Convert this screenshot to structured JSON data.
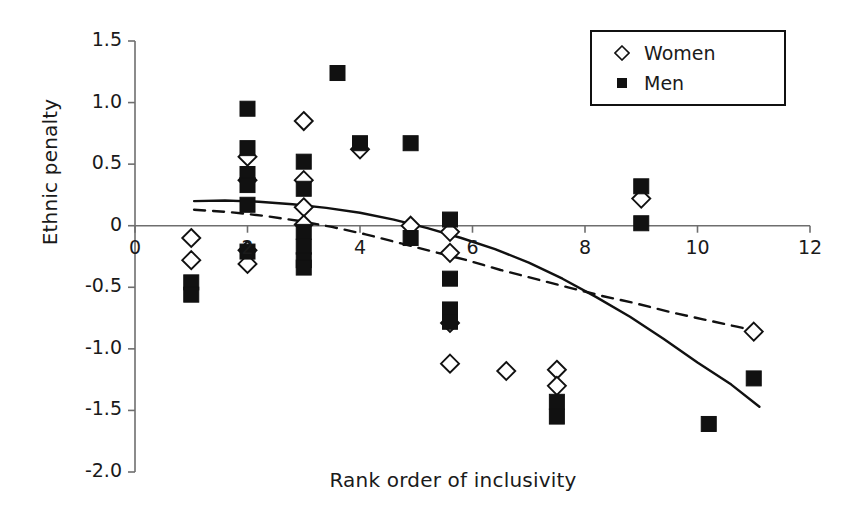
{
  "chart_data": {
    "type": "scatter",
    "title": "",
    "xlabel": "Rank order of inclusivity",
    "ylabel": "Ethnic penalty",
    "xlim": [
      0,
      12
    ],
    "ylim": [
      -2.0,
      1.5
    ],
    "xticks": [
      0,
      2,
      4,
      6,
      8,
      10,
      12
    ],
    "xtick_labels": [
      "0",
      "2",
      "4",
      "6",
      "8",
      "10",
      "12"
    ],
    "yticks": [
      1.5,
      1.0,
      0.5,
      0,
      -0.5,
      -1.0,
      -1.5,
      -2.0
    ],
    "ytick_labels": [
      "1.5",
      "1.0",
      "0.5",
      "0",
      "-0.5",
      "-1.0",
      "-1.5",
      "-2.0"
    ],
    "grid": false,
    "legend_position": "top-right",
    "series": [
      {
        "name": "Women",
        "marker": "open-diamond",
        "color": "#ffffff",
        "edge_color": "#111111",
        "points": [
          {
            "x": 1.0,
            "y": -0.1
          },
          {
            "x": 1.0,
            "y": -0.28
          },
          {
            "x": 2.0,
            "y": 0.56
          },
          {
            "x": 2.0,
            "y": 0.37
          },
          {
            "x": 2.0,
            "y": -0.2
          },
          {
            "x": 2.0,
            "y": -0.31
          },
          {
            "x": 3.0,
            "y": 0.85
          },
          {
            "x": 3.0,
            "y": 0.37
          },
          {
            "x": 3.0,
            "y": 0.15
          },
          {
            "x": 3.0,
            "y": 0.01
          },
          {
            "x": 4.0,
            "y": 0.62
          },
          {
            "x": 4.9,
            "y": 0.0
          },
          {
            "x": 5.6,
            "y": -0.05
          },
          {
            "x": 5.6,
            "y": -0.22
          },
          {
            "x": 5.6,
            "y": -0.79
          },
          {
            "x": 5.6,
            "y": -1.12
          },
          {
            "x": 6.6,
            "y": -1.18
          },
          {
            "x": 7.5,
            "y": -1.17
          },
          {
            "x": 7.5,
            "y": -1.3
          },
          {
            "x": 9.0,
            "y": 0.22
          },
          {
            "x": 11.0,
            "y": -0.86
          }
        ]
      },
      {
        "name": "Men",
        "marker": "filled-square",
        "color": "#111111",
        "edge_color": "#111111",
        "points": [
          {
            "x": 1.0,
            "y": -0.46
          },
          {
            "x": 1.0,
            "y": -0.56
          },
          {
            "x": 2.0,
            "y": 0.95
          },
          {
            "x": 2.0,
            "y": 0.63
          },
          {
            "x": 2.0,
            "y": 0.42
          },
          {
            "x": 2.0,
            "y": 0.33
          },
          {
            "x": 2.0,
            "y": 0.17
          },
          {
            "x": 2.0,
            "y": -0.21
          },
          {
            "x": 3.0,
            "y": 0.52
          },
          {
            "x": 3.0,
            "y": 0.3
          },
          {
            "x": 3.0,
            "y": -0.05
          },
          {
            "x": 3.0,
            "y": -0.17
          },
          {
            "x": 3.0,
            "y": -0.28
          },
          {
            "x": 3.0,
            "y": -0.34
          },
          {
            "x": 3.6,
            "y": 1.24
          },
          {
            "x": 4.0,
            "y": 0.67
          },
          {
            "x": 4.9,
            "y": 0.67
          },
          {
            "x": 4.9,
            "y": -0.1
          },
          {
            "x": 5.6,
            "y": 0.05
          },
          {
            "x": 5.6,
            "y": -0.43
          },
          {
            "x": 5.6,
            "y": -0.68
          },
          {
            "x": 5.6,
            "y": -0.78
          },
          {
            "x": 7.5,
            "y": -1.43
          },
          {
            "x": 7.5,
            "y": -1.55
          },
          {
            "x": 9.0,
            "y": 0.32
          },
          {
            "x": 9.0,
            "y": 0.02
          },
          {
            "x": 10.2,
            "y": -1.61
          },
          {
            "x": 11.0,
            "y": -1.24
          }
        ]
      }
    ],
    "trend_lines": [
      {
        "name": "Men trend",
        "style": "solid",
        "color": "#111111",
        "points": [
          {
            "x": 1.05,
            "y": 0.2
          },
          {
            "x": 1.6,
            "y": 0.205
          },
          {
            "x": 2.2,
            "y": 0.195
          },
          {
            "x": 2.8,
            "y": 0.175
          },
          {
            "x": 3.4,
            "y": 0.145
          },
          {
            "x": 4.0,
            "y": 0.105
          },
          {
            "x": 4.6,
            "y": 0.05
          },
          {
            "x": 5.2,
            "y": -0.02
          },
          {
            "x": 5.8,
            "y": -0.1
          },
          {
            "x": 6.4,
            "y": -0.19
          },
          {
            "x": 7.0,
            "y": -0.3
          },
          {
            "x": 7.6,
            "y": -0.43
          },
          {
            "x": 8.2,
            "y": -0.58
          },
          {
            "x": 8.8,
            "y": -0.74
          },
          {
            "x": 9.4,
            "y": -0.92
          },
          {
            "x": 10.0,
            "y": -1.11
          },
          {
            "x": 10.6,
            "y": -1.29
          },
          {
            "x": 11.1,
            "y": -1.47
          }
        ]
      },
      {
        "name": "Women trend",
        "style": "dashed",
        "color": "#111111",
        "points": [
          {
            "x": 1.05,
            "y": 0.13
          },
          {
            "x": 1.7,
            "y": 0.11
          },
          {
            "x": 2.3,
            "y": 0.08
          },
          {
            "x": 2.9,
            "y": 0.04
          },
          {
            "x": 3.5,
            "y": -0.01
          },
          {
            "x": 4.1,
            "y": -0.07
          },
          {
            "x": 4.7,
            "y": -0.14
          },
          {
            "x": 5.3,
            "y": -0.21
          },
          {
            "x": 5.9,
            "y": -0.28
          },
          {
            "x": 6.5,
            "y": -0.36
          },
          {
            "x": 7.1,
            "y": -0.43
          },
          {
            "x": 7.7,
            "y": -0.5
          },
          {
            "x": 8.3,
            "y": -0.57
          },
          {
            "x": 8.9,
            "y": -0.63
          },
          {
            "x": 9.5,
            "y": -0.7
          },
          {
            "x": 10.1,
            "y": -0.76
          },
          {
            "x": 10.7,
            "y": -0.82
          },
          {
            "x": 11.1,
            "y": -0.86
          }
        ]
      }
    ]
  },
  "legend": {
    "items": [
      {
        "label": "Women",
        "marker": "open-diamond"
      },
      {
        "label": "Men",
        "marker": "filled-square"
      }
    ]
  }
}
